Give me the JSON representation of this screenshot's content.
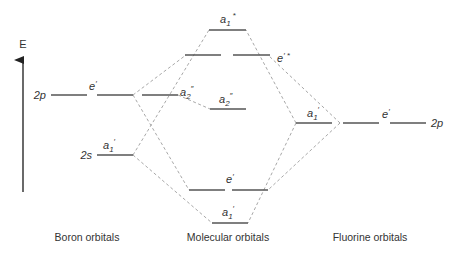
{
  "axis": {
    "label": "E"
  },
  "boron": {
    "caption": "Boron orbitals",
    "p_label": "2p",
    "s_label": "2s",
    "p_sym": "e",
    "p_sym_prime": "′",
    "p2_sym": "a",
    "p2_sub": "2",
    "p2_prime": "″",
    "s_sym": "a",
    "s_sub": "1",
    "s_prime": "′"
  },
  "molecular": {
    "caption": "Molecular orbitals",
    "a1_star": {
      "sym": "a",
      "sub": "1",
      "sup": "*"
    },
    "e_star": {
      "sym": "e",
      "sup": "′ *"
    },
    "a2": {
      "sym": "a",
      "sub": "2",
      "sup": "″"
    },
    "e_bond": {
      "sym": "e",
      "sup": "′"
    },
    "a1_bond": {
      "sym": "a",
      "sub": "1",
      "sup": "′"
    }
  },
  "fluorine": {
    "caption": "Fluorine orbitals",
    "p_label": "2p",
    "a1": {
      "sym": "a",
      "sub": "1",
      "sup": "′"
    },
    "e": {
      "sym": "e",
      "sup": "′"
    }
  },
  "colors": {
    "level": "#555555",
    "correlation": "#a8a8a8",
    "text": "#333333"
  }
}
